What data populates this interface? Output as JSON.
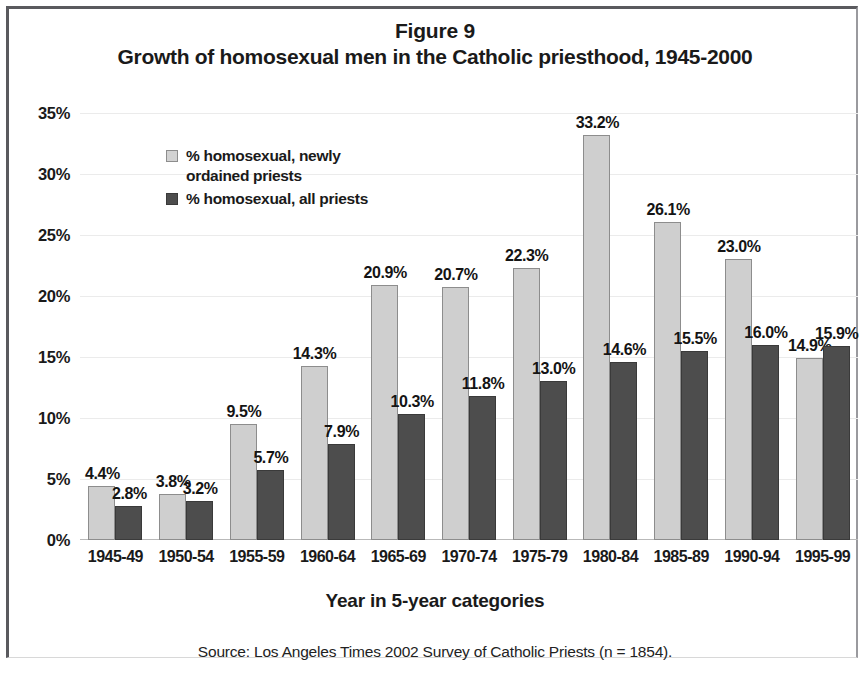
{
  "figure": {
    "number": "Figure 9",
    "title": "Growth of homosexual men in the Catholic priesthood, 1945-2000",
    "axis_title": "Year in 5-year categories",
    "source": "Source: Los Angeles Times 2002 Survey of Catholic Priests (n = 1854)."
  },
  "colors": {
    "series_light": "#cfcfcf",
    "series_dark": "#4d4d4d",
    "gridline": "#ebebeb",
    "text": "#1a1a1a",
    "frame": "#5a5a5e"
  },
  "chart_data": {
    "type": "bar",
    "title": "Growth of homosexual men in the Catholic priesthood, 1945-2000",
    "subtitle": "Figure 9",
    "xlabel": "Year in 5-year categories",
    "ylabel": "",
    "ylim": [
      0,
      35
    ],
    "ytick_labels": [
      "0%",
      "5%",
      "10%",
      "15%",
      "20%",
      "25%",
      "30%",
      "35%"
    ],
    "ytick_values": [
      0,
      5,
      10,
      15,
      20,
      25,
      30,
      35
    ],
    "grid": true,
    "legend_position": "upper-left-inside",
    "categories": [
      "1945-49",
      "1950-54",
      "1955-59",
      "1960-64",
      "1965-69",
      "1970-74",
      "1975-79",
      "1980-84",
      "1985-89",
      "1990-94",
      "1995-99"
    ],
    "series": [
      {
        "name": "% homosexual, newly ordained priests",
        "color": "#cfcfcf",
        "values": [
          4.4,
          3.8,
          9.5,
          14.3,
          20.9,
          20.7,
          22.3,
          33.2,
          26.1,
          23.0,
          14.9
        ],
        "value_labels": [
          "4.4%",
          "3.8%",
          "9.5%",
          "14.3%",
          "20.9%",
          "20.7%",
          "22.3%",
          "33.2%",
          "26.1%",
          "23.0%",
          "14.9%"
        ]
      },
      {
        "name": "% homosexual, all priests",
        "color": "#4d4d4d",
        "values": [
          2.8,
          3.2,
          5.7,
          7.9,
          10.3,
          11.8,
          13.0,
          14.6,
          15.5,
          16.0,
          15.9
        ],
        "value_labels": [
          "2.8%",
          "3.2%",
          "5.7%",
          "7.9%",
          "10.3%",
          "11.8%",
          "13.0%",
          "14.6%",
          "15.5%",
          "16.0%",
          "15.9%"
        ]
      }
    ],
    "annotations": [
      "Source: Los Angeles Times 2002 Survey of Catholic Priests (n = 1854)."
    ]
  },
  "legend": {
    "items": [
      {
        "label": "% homosexual, newly ordained priests",
        "swatch": "light"
      },
      {
        "label": "% homosexual, all priests",
        "swatch": "dark"
      }
    ]
  }
}
